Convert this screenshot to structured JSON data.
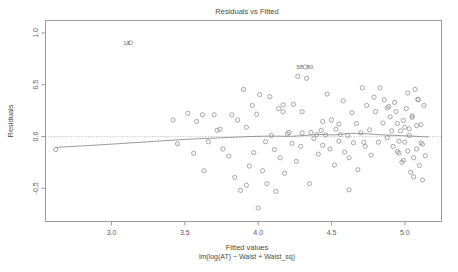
{
  "chart_data": {
    "type": "scatter",
    "title": "Residuals vs Fitted",
    "xlabel": "Fitted values",
    "xlabel_sub": "lm(log(AT) ~ Waist + Waist_sq)",
    "ylabel": "Residuals",
    "xlim": [
      2.55,
      5.25
    ],
    "ylim": [
      -0.82,
      1.12
    ],
    "xticks": [
      3.0,
      3.5,
      4.0,
      4.5,
      5.0
    ],
    "xtick_labels": [
      "3.0",
      "3.5",
      "4.0",
      "4.5",
      "5.0"
    ],
    "yticks": [
      -0.5,
      0.0,
      0.5,
      1.0
    ],
    "ytick_labels": [
      "-0.5",
      "0.0",
      "0.5",
      "1.0"
    ],
    "grid": false,
    "legend": "none",
    "marker": "open-circle",
    "marker_color": "#8a8a8a",
    "smoother_color": "#8d8d8d",
    "zero_line_color": "#bdbdbd",
    "frame_color": "#9a9a9a",
    "point_labels": [
      {
        "text": "18",
        "x": 3.15,
        "y": 0.905
      },
      {
        "text": "58",
        "x": 4.33,
        "y": 0.672
      },
      {
        "text": "80",
        "x": 4.4,
        "y": 0.668
      }
    ],
    "x": [
      2.62,
      3.13,
      3.42,
      3.45,
      3.52,
      3.56,
      3.58,
      3.62,
      3.63,
      3.66,
      3.7,
      3.72,
      3.74,
      3.76,
      3.8,
      3.82,
      3.84,
      3.86,
      3.88,
      3.9,
      3.92,
      3.94,
      3.96,
      3.97,
      3.99,
      4.0,
      4.01,
      4.03,
      4.05,
      4.06,
      4.08,
      4.09,
      4.11,
      4.12,
      4.14,
      4.15,
      4.17,
      4.18,
      4.2,
      4.21,
      4.23,
      4.24,
      4.26,
      4.27,
      4.29,
      4.3,
      4.32,
      4.33,
      4.35,
      4.36,
      4.38,
      4.4,
      4.41,
      4.43,
      4.44,
      4.46,
      4.47,
      4.49,
      4.5,
      4.52,
      4.53,
      4.55,
      4.56,
      4.58,
      4.59,
      4.61,
      4.62,
      4.64,
      4.65,
      4.67,
      4.68,
      4.7,
      4.71,
      4.73,
      4.74,
      4.76,
      4.77,
      4.79,
      4.8,
      4.82,
      4.83,
      4.85,
      4.86,
      4.88,
      4.89,
      4.9,
      4.91,
      4.92,
      4.93,
      4.94,
      4.95,
      4.96,
      4.97,
      4.98,
      4.99,
      5.0,
      5.01,
      5.02,
      5.03,
      5.04,
      5.05,
      5.06,
      5.07,
      5.08,
      5.09,
      5.1,
      5.11,
      5.12,
      5.13,
      5.14,
      4.3,
      4.62,
      4.96,
      5.03,
      5.08,
      5.11,
      5.05,
      4.99,
      5.06,
      5.02,
      4.88,
      4.95,
      5.0,
      5.09,
      5.12,
      4.44,
      4.17,
      3.92,
      4.72,
      4.55
    ],
    "y": [
      -0.125,
      0.905,
      0.16,
      -0.07,
      0.225,
      -0.16,
      0.145,
      0.21,
      -0.33,
      -0.05,
      0.21,
      0.06,
      0.07,
      -0.12,
      -0.19,
      0.21,
      -0.395,
      0.16,
      -0.52,
      0.455,
      0.09,
      -0.285,
      0.3,
      -0.155,
      0.215,
      -0.69,
      0.405,
      -0.33,
      -0.05,
      -0.455,
      0.385,
      0.01,
      -0.125,
      -0.53,
      0.27,
      -0.205,
      0.305,
      -0.355,
      0.025,
      0.04,
      -0.065,
      0.31,
      -0.24,
      0.58,
      -0.095,
      0.035,
      0.672,
      0.562,
      -0.455,
      0.04,
      -0.02,
      0.02,
      -0.17,
      0.06,
      -0.085,
      0.015,
      0.41,
      -0.12,
      0.16,
      -0.275,
      0.07,
      -0.045,
      0.02,
      0.345,
      -0.15,
      0.01,
      -0.205,
      0.23,
      -0.06,
      0.125,
      -0.32,
      0.035,
      0.47,
      -0.095,
      0.3,
      0.065,
      -0.18,
      0.38,
      0.24,
      -0.055,
      0.47,
      0.13,
      0.355,
      -0.01,
      0.29,
      0.19,
      0.055,
      -0.095,
      0.33,
      0.24,
      0.125,
      -0.16,
      0.055,
      -0.25,
      0.155,
      -0.055,
      0.27,
      -0.14,
      0.075,
      -0.345,
      0.2,
      -0.205,
      0.455,
      -0.12,
      0.36,
      -0.28,
      0.115,
      -0.42,
      0.3,
      -0.185,
      0.24,
      -0.515,
      -0.045,
      0.01,
      0.105,
      -0.06,
      0.185,
      -0.23,
      -0.39,
      0.42,
      0.275,
      -0.145,
      0.09,
      0.355,
      -0.075,
      0.145,
      0.24,
      -0.47,
      -0.055,
      0.12,
      0.075,
      0.095
    ],
    "smoother": {
      "x": [
        2.62,
        2.9,
        3.2,
        3.5,
        3.75,
        3.95,
        4.1,
        4.22,
        4.33,
        4.42,
        4.52,
        4.62,
        4.72,
        4.82,
        4.92,
        5.02,
        5.1,
        5.16
      ],
      "y": [
        -0.105,
        -0.082,
        -0.055,
        -0.028,
        -0.012,
        0.0,
        0.004,
        0.002,
        0.012,
        0.02,
        0.016,
        0.03,
        0.028,
        0.018,
        0.012,
        0.006,
        0.0,
        -0.004
      ]
    }
  }
}
